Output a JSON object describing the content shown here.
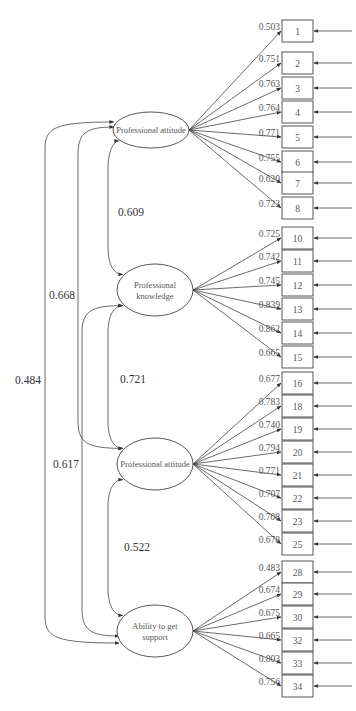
{
  "diagram": {
    "type": "structural equation model / confirmatory factor analysis path diagram",
    "latent_variables": [
      {
        "id": "F1",
        "label_lines": [
          "Professional attitude"
        ],
        "cx": 151,
        "cy": 130,
        "rx": 38,
        "ry": 18,
        "indicators": [
          {
            "item": "1",
            "loading": "0.503",
            "y": 31
          },
          {
            "item": "2",
            "loading": "0.751",
            "y": 63
          },
          {
            "item": "3",
            "loading": "0.763",
            "y": 88
          },
          {
            "item": "4",
            "loading": "0.764",
            "y": 112
          },
          {
            "item": "5",
            "loading": "0.771",
            "y": 137
          },
          {
            "item": "6",
            "loading": "0.755",
            "y": 162
          },
          {
            "item": "7",
            "loading": "0.620",
            "y": 183
          },
          {
            "item": "8",
            "loading": "0.723",
            "y": 208
          }
        ]
      },
      {
        "id": "F2",
        "label_lines": [
          "Professional",
          "knowledge"
        ],
        "cx": 155,
        "cy": 290,
        "rx": 38,
        "ry": 26,
        "indicators": [
          {
            "item": "10",
            "loading": "0.725",
            "y": 238
          },
          {
            "item": "11",
            "loading": "0.742",
            "y": 261
          },
          {
            "item": "12",
            "loading": "0.745",
            "y": 285
          },
          {
            "item": "13",
            "loading": "0.839",
            "y": 309
          },
          {
            "item": "14",
            "loading": "0.862",
            "y": 333
          },
          {
            "item": "15",
            "loading": "0.665",
            "y": 357
          }
        ]
      },
      {
        "id": "F3",
        "label_lines": [
          "Professional attitude"
        ],
        "cx": 155,
        "cy": 464,
        "rx": 38,
        "ry": 26,
        "indicators": [
          {
            "item": "16",
            "loading": "0.677",
            "y": 383
          },
          {
            "item": "18",
            "loading": "0.783",
            "y": 406
          },
          {
            "item": "19",
            "loading": "0.740",
            "y": 429
          },
          {
            "item": "20",
            "loading": "0.794",
            "y": 452
          },
          {
            "item": "21",
            "loading": "0.771",
            "y": 475
          },
          {
            "item": "22",
            "loading": "0.707",
            "y": 498
          },
          {
            "item": "23",
            "loading": "0.708",
            "y": 521
          },
          {
            "item": "25",
            "loading": "0.678",
            "y": 544
          }
        ]
      },
      {
        "id": "F4",
        "label_lines": [
          "Ability to get",
          "support"
        ],
        "cx": 155,
        "cy": 631,
        "rx": 38,
        "ry": 26,
        "indicators": [
          {
            "item": "28",
            "loading": "0.483",
            "y": 572
          },
          {
            "item": "29",
            "loading": "0.674",
            "y": 594
          },
          {
            "item": "30",
            "loading": "0.675",
            "y": 617
          },
          {
            "item": "32",
            "loading": "0.665",
            "y": 640
          },
          {
            "item": "33",
            "loading": "0.803",
            "y": 663
          },
          {
            "item": "34",
            "loading": "0.756",
            "y": 686
          }
        ]
      }
    ],
    "correlations": [
      {
        "from": "F1",
        "to": "F2",
        "value": "0.609",
        "label_x": 118,
        "label_y": 216
      },
      {
        "from": "F2",
        "to": "F3",
        "value": "0.721",
        "label_x": 120,
        "label_y": 383
      },
      {
        "from": "F3",
        "to": "F4",
        "value": "0.522",
        "label_x": 124,
        "label_y": 551
      },
      {
        "from": "F1",
        "to": "F3",
        "value": "0.668",
        "label_x": 49,
        "label_y": 299
      },
      {
        "from": "F2",
        "to": "F4",
        "value": "0.617",
        "label_x": 53,
        "label_y": 468
      },
      {
        "from": "F1",
        "to": "F4",
        "value": "0.484",
        "label_x": 15,
        "label_y": 384
      }
    ],
    "colors": {
      "line": "#444444",
      "text": "#555555",
      "background": "#ffffff"
    }
  }
}
